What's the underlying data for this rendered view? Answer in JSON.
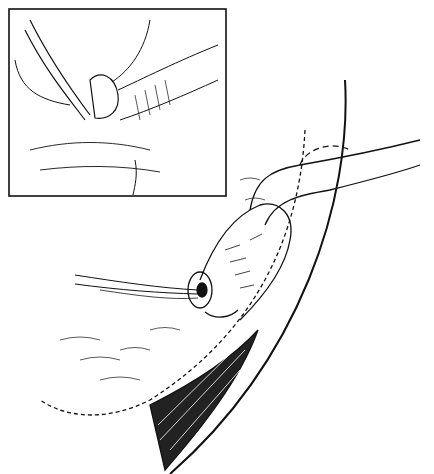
{
  "figure": {
    "text": [],
    "colors": {
      "ink": "#111111",
      "background": "#ffffff"
    },
    "inset": {
      "x": 9,
      "y": 9,
      "width": 217,
      "height": 187
    }
  }
}
